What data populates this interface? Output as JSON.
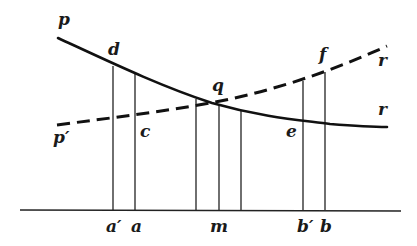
{
  "diagram": {
    "type": "supply-demand style curve diagram",
    "curves": [
      {
        "name": "solid-curve",
        "style": "solid",
        "start_label": "p",
        "end_label": "r"
      },
      {
        "name": "dashed-curve",
        "style": "dashed",
        "start_label": "p′",
        "end_label": "r"
      }
    ],
    "intersection_label": "q",
    "point_labels": {
      "d": "d",
      "c": "c",
      "e": "e",
      "f": "f",
      "q": "q"
    },
    "curve_end_labels": {
      "solid_start": "p",
      "dashed_start": "p′",
      "solid_end": "r",
      "dashed_end": "r"
    },
    "axis_labels": [
      {
        "id": "a_prime",
        "text": "a′"
      },
      {
        "id": "a",
        "text": "a"
      },
      {
        "id": "m",
        "text": "m"
      },
      {
        "id": "b_prime",
        "text": "b′"
      },
      {
        "id": "b",
        "text": "b"
      }
    ],
    "colors": {
      "ink": "#111111",
      "background": "#ffffff"
    }
  }
}
